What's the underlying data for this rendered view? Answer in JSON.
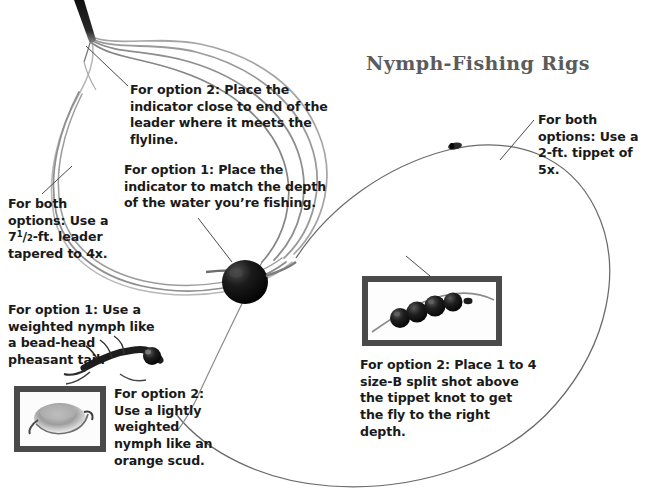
{
  "page": {
    "title": "Nymph-Fishing Rigs",
    "background_color": "#ffffff",
    "title_color": "#5b5b5b",
    "text_color": "#1a1a1a",
    "width": 661,
    "height": 498
  },
  "callouts": {
    "option2_indicator": "For option 2: Place the indicator close to end of the leader where it meets the flyline.",
    "option1_indicator": "For option 1: Place the indicator to match the depth of the water you’re fishing.",
    "leader_both_line1": "For both options: Use a",
    "leader_both_frac_whole": "7",
    "leader_both_frac_num": "1",
    "leader_both_frac_den": "2",
    "leader_both_line2": "-ft. leader tapered to 4x.",
    "tippet_both": "For both options: Use a 2-ft. tippet of 5x.",
    "option1_nymph": "For option 1: Use a weighted nymph like a bead-head pheasant tail.",
    "option2_nymph": "For option 2: Use a lightly weighted nymph like an orange scud.",
    "split_shot": "For option 2: Place 1 to 4 size-B split shot above the tippet knot to get the fly to the right depth."
  },
  "figure_elements": {
    "flyline_tip": "fly-line-tip",
    "leader_coils": "coiled-monofilament-leader",
    "strike_indicator": "black-round-strike-indicator",
    "tippet_knot": "tippet-knot",
    "tippet_line": "thin-tippet-line",
    "photo_split_shot": "framed-photo-split-shot-on-line",
    "photo_scud": "framed-photo-orange-scud-nymph",
    "photo_pheasant_tail": "photo-bead-head-pheasant-tail-nymph",
    "split_shot_count": 4
  },
  "colors": {
    "leader_gray": "#9a9a9a",
    "leader_gray_dark": "#6e6e6e",
    "tippet_gray": "#555555",
    "frame_border": "#4a4a4a",
    "indicator_black": "#121212",
    "leader_line_text": "#1a1a1a"
  }
}
